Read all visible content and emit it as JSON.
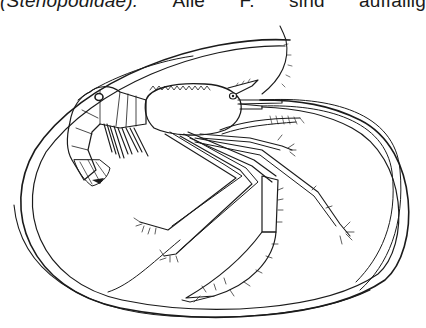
{
  "page": {
    "text_line": {
      "part1": "(Stenopodidae).",
      "part2": "Alle",
      "part3": "F.",
      "part4": "sind",
      "part5": "auffällig"
    },
    "figure": {
      "subject": "shrimp-illustration",
      "description": "Line drawing of a stenopodid shrimp with long antennae inside an oval frame",
      "ink_color": "#1b1b1b",
      "background": "#ffffff"
    }
  }
}
